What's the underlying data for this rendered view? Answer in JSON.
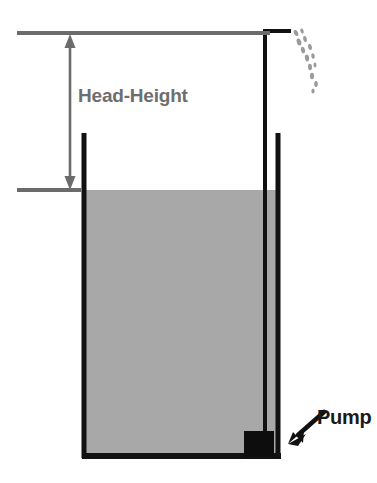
{
  "figure": {
    "type": "schematic-diagram",
    "canvas": {
      "width": 377,
      "height": 483,
      "background": "#ffffff"
    }
  },
  "labels": {
    "head_height": "Head-Height",
    "pump": "Pump"
  },
  "colors": {
    "water_fill": "#a8a8a8",
    "tank_outline": "#111111",
    "reference_line": "#6b6b6b",
    "dimension_arrow": "#6b6b6b",
    "head_height_text": "#6e6e6e",
    "pump_text": "#1a1a1a",
    "pump_body": "#0d0d0d",
    "droplet": "#9a9a9a",
    "background": "#ffffff"
  },
  "icons": {
    "dimension_arrow": "double-headed-vertical-arrow-icon",
    "pump_pointer": "arrow-pointer-icon",
    "spray": "water-droplets-icon"
  },
  "geometry": {
    "tank": {
      "left": 82,
      "right": 280,
      "top_left_wall": 133,
      "bottom": 458,
      "wall_width": 5
    },
    "water_level_y": 190,
    "top_reference_line": {
      "x1": 17,
      "x2": 270,
      "y": 33
    },
    "lower_reference_line": {
      "x1": 17,
      "x2": 80,
      "y": 190
    },
    "dimension_arrow": {
      "x": 70,
      "y_top": 38,
      "y_bottom": 186
    },
    "pipe": {
      "vertical_x": 265,
      "top_y": 31,
      "bottom_y": 440,
      "elbow_x2": 291
    },
    "pump_box": {
      "x": 244,
      "y": 431,
      "width": 30,
      "height": 27
    },
    "pump_pointer": {
      "x1": 323,
      "y1": 414,
      "x2": 290,
      "y2": 443
    }
  },
  "droplets": [
    {
      "cx": 296,
      "cy": 33,
      "rx": 2.0,
      "ry": 3.2,
      "rot": -25
    },
    {
      "cx": 302,
      "cy": 31,
      "rx": 1.6,
      "ry": 2.6,
      "rot": -20
    },
    {
      "cx": 299,
      "cy": 42,
      "rx": 2.2,
      "ry": 3.6,
      "rot": -18
    },
    {
      "cx": 305,
      "cy": 39,
      "rx": 1.8,
      "ry": 3.0,
      "rot": -15
    },
    {
      "cx": 303,
      "cy": 50,
      "rx": 2.0,
      "ry": 3.4,
      "rot": -12
    },
    {
      "cx": 310,
      "cy": 47,
      "rx": 1.9,
      "ry": 3.0,
      "rot": -10
    },
    {
      "cx": 307,
      "cy": 58,
      "rx": 2.1,
      "ry": 3.4,
      "rot": -8
    },
    {
      "cx": 313,
      "cy": 56,
      "rx": 1.7,
      "ry": 2.8,
      "rot": -8
    },
    {
      "cx": 310,
      "cy": 67,
      "rx": 2.0,
      "ry": 3.2,
      "rot": -5
    },
    {
      "cx": 315,
      "cy": 65,
      "rx": 1.5,
      "ry": 2.4,
      "rot": -5
    },
    {
      "cx": 312,
      "cy": 76,
      "rx": 2.0,
      "ry": 3.2,
      "rot": 0
    },
    {
      "cx": 316,
      "cy": 84,
      "rx": 1.8,
      "ry": 3.0,
      "rot": 0
    },
    {
      "cx": 313,
      "cy": 91,
      "rx": 1.6,
      "ry": 2.6,
      "rot": 0
    }
  ]
}
